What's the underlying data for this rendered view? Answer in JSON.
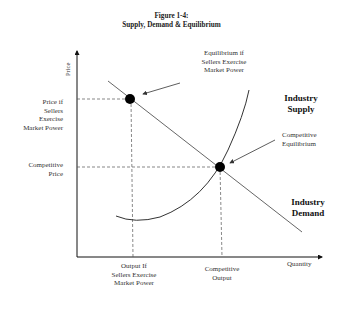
{
  "figure": {
    "number": "Figure 1-4:",
    "title": "Supply, Demand & Equilibrium"
  },
  "axes": {
    "y_label": "Price",
    "x_label": "Quantity"
  },
  "curves": {
    "supply_label_line1": "Industry",
    "supply_label_line2": "Supply",
    "demand_label_line1": "Industry",
    "demand_label_line2": "Demand"
  },
  "annotations": {
    "market_power_eq": [
      "Equilibrium if",
      "Sellers Exercise",
      "Market Power"
    ],
    "competitive_eq": [
      "Competitive",
      "Equilibrium"
    ]
  },
  "y_ticks": {
    "market_power_price": [
      "Price if",
      "Sellers",
      "Exercise",
      "Market Power"
    ],
    "competitive_price": [
      "Competitive",
      "Price"
    ]
  },
  "x_ticks": {
    "market_power_output": [
      "Output If",
      "Sellers Exercise",
      "Market Power"
    ],
    "competitive_output": [
      "Competitive",
      "Output"
    ]
  },
  "colors": {
    "axis": "#111111",
    "curve": "#444444",
    "point": "#000000"
  }
}
